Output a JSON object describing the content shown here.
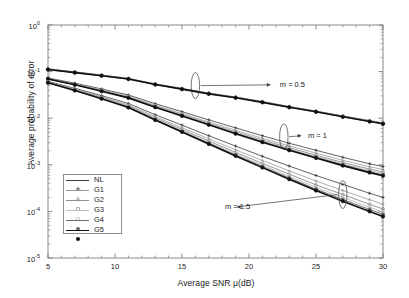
{
  "chart_data": {
    "type": "line",
    "title": "",
    "xlabel": "Average SNR μ(dB)",
    "ylabel": "Average probability of error",
    "xlim": [
      5,
      30
    ],
    "ylim": [
      1e-05,
      1
    ],
    "xscale": "linear",
    "yscale": "log",
    "xticks": [
      5,
      10,
      15,
      20,
      25,
      30
    ],
    "xticklabels": [
      "5",
      "10",
      "15",
      "20",
      "25",
      "30"
    ],
    "yticks": [
      1,
      0.1,
      0.01,
      0.001,
      0.0001,
      1e-05
    ],
    "yticklabels": [
      "10",
      "10",
      "10",
      "10",
      "10",
      "10"
    ],
    "yticklabel_exponents": [
      "0",
      "-1",
      "-2",
      "-3",
      "-4",
      "-5"
    ],
    "grid": false,
    "legend_position": "lower left",
    "x": [
      5,
      7,
      9,
      11,
      13,
      15,
      17,
      19,
      21,
      23,
      25,
      27,
      29,
      30
    ],
    "groups": [
      {
        "name": "m = 0.5",
        "series": [
          {
            "name": "NL",
            "values": [
              0.115,
              0.0985,
              0.0845,
              0.0715,
              0.0545,
              0.0435,
              0.0345,
              0.0285,
              0.0228,
              0.0178,
              0.0142,
              0.0112,
              0.0089,
              0.0079
            ]
          },
          {
            "name": "G1",
            "values": [
              0.113,
              0.097,
              0.0832,
              0.0705,
              0.0537,
              0.0428,
              0.034,
              0.028,
              0.0224,
              0.0175,
              0.014,
              0.011,
              0.0087,
              0.0078
            ]
          },
          {
            "name": "G2",
            "values": [
              0.112,
              0.0962,
              0.0825,
              0.07,
              0.0533,
              0.0425,
              0.0337,
              0.0278,
              0.0222,
              0.0174,
              0.0139,
              0.0109,
              0.0086,
              0.0077
            ]
          },
          {
            "name": "G3",
            "values": [
              0.112,
              0.0958,
              0.0821,
              0.0697,
              0.0531,
              0.0423,
              0.0336,
              0.0277,
              0.0221,
              0.0173,
              0.0138,
              0.0108,
              0.0086,
              0.0077
            ]
          },
          {
            "name": "G4",
            "values": [
              0.111,
              0.0955,
              0.0818,
              0.0694,
              0.0529,
              0.0421,
              0.0334,
              0.0276,
              0.022,
              0.0172,
              0.0137,
              0.0108,
              0.0085,
              0.0076
            ]
          },
          {
            "name": "G5",
            "values": [
              0.111,
              0.0952,
              0.0816,
              0.0692,
              0.0527,
              0.042,
              0.0333,
              0.0275,
              0.0219,
              0.0172,
              0.0137,
              0.0107,
              0.0085,
              0.0076
            ]
          }
        ]
      },
      {
        "name": "m = 1",
        "series": [
          {
            "name": "NL",
            "values": [
              0.073,
              0.0565,
              0.0425,
              0.0315,
              0.0205,
              0.0138,
              0.0092,
              0.0062,
              0.0042,
              0.0029,
              0.00205,
              0.00145,
              0.00105,
              0.00092
            ]
          },
          {
            "name": "G1",
            "values": [
              0.0715,
              0.0545,
              0.0405,
              0.0296,
              0.019,
              0.0126,
              0.0083,
              0.0055,
              0.0037,
              0.00255,
              0.00178,
              0.00125,
              0.00091,
              0.00079
            ]
          },
          {
            "name": "G2",
            "values": [
              0.0705,
              0.0535,
              0.0394,
              0.0286,
              0.0182,
              0.012,
              0.0078,
              0.0051,
              0.0034,
              0.00233,
              0.00161,
              0.00112,
              0.00081,
              0.0007
            ]
          },
          {
            "name": "G3",
            "values": [
              0.07,
              0.0528,
              0.0387,
              0.028,
              0.0177,
              0.0116,
              0.0075,
              0.0049,
              0.00325,
              0.0022,
              0.00152,
              0.00105,
              0.00075,
              0.00065
            ]
          },
          {
            "name": "G4",
            "values": [
              0.0696,
              0.0524,
              0.0383,
              0.0276,
              0.0174,
              0.0113,
              0.00732,
              0.00475,
              0.00313,
              0.00211,
              0.00145,
              0.001,
              0.00071,
              0.00061
            ]
          },
          {
            "name": "G5",
            "values": [
              0.0693,
              0.0521,
              0.038,
              0.0273,
              0.0172,
              0.0112,
              0.0072,
              0.00465,
              0.00305,
              0.00205,
              0.0014,
              0.00096,
              0.00068,
              0.00058
            ]
          }
        ]
      },
      {
        "name": "m = 1.5",
        "series": [
          {
            "name": "NL",
            "values": [
              0.0615,
              0.0438,
              0.0305,
              0.0207,
              0.0119,
              0.0071,
              0.0042,
              0.00252,
              0.00152,
              0.00094,
              0.00059,
              0.00038,
              0.000245,
              0.0002
            ]
          },
          {
            "name": "G1",
            "values": [
              0.06,
              0.042,
              0.0288,
              0.0192,
              0.0108,
              0.00625,
              0.0036,
              0.0021,
              0.00124,
              0.00074,
              0.00045,
              0.00028,
              0.000178,
              0.000143
            ]
          },
          {
            "name": "G2",
            "values": [
              0.059,
              0.0409,
              0.0277,
              0.0182,
              0.0101,
              0.00573,
              0.00324,
              0.00185,
              0.00107,
              0.00063,
              0.00037,
              0.00023,
              0.000142,
              0.000113
            ]
          },
          {
            "name": "G3",
            "values": [
              0.0584,
              0.0402,
              0.027,
              0.0176,
              0.00965,
              0.00542,
              0.00303,
              0.00171,
              0.00098,
              0.00056,
              0.00033,
              0.0002,
              0.000123,
              9.75e-05
            ]
          },
          {
            "name": "G4",
            "values": [
              0.058,
              0.0397,
              0.0265,
              0.0172,
              0.00935,
              0.0052,
              0.00289,
              0.00162,
              0.00092,
              0.00052,
              0.0003,
              0.00018,
              0.00011,
              8.65e-05
            ]
          },
          {
            "name": "G5",
            "values": [
              0.0577,
              0.0394,
              0.0262,
              0.0169,
              0.00915,
              0.00506,
              0.0028,
              0.00155,
              0.00087,
              0.00049,
              0.00028,
              0.000166,
              0.0001,
              7.8e-05
            ]
          }
        ]
      }
    ],
    "annotations": [
      {
        "text": "m = 0.5",
        "x": 22.3,
        "y": 0.052,
        "arrow": "right"
      },
      {
        "text": "m = 1",
        "x": 24.4,
        "y": 0.0042,
        "arrow": "right"
      },
      {
        "text": "m = 1.5",
        "x": 18.2,
        "y": 0.000125,
        "arrow": "left"
      }
    ]
  },
  "legend": {
    "items": [
      {
        "label": "NL",
        "marker": "plus",
        "color": "#3a3a3a",
        "width": 0.8
      },
      {
        "label": "G1",
        "marker": "plus",
        "color": "#9a9a9a",
        "width": 0.8
      },
      {
        "label": "G2",
        "marker": "circle",
        "color": "#8c8c8c",
        "width": 0.9
      },
      {
        "label": "G3",
        "marker": "circle",
        "color": "#bdbdbd",
        "width": 0.9
      },
      {
        "label": "G4",
        "marker": "dot",
        "color": "#6b6b6b",
        "width": 1.0
      },
      {
        "label": "G5",
        "marker": "dot",
        "color": "#111111",
        "width": 1.6
      }
    ]
  },
  "axes": {
    "xlabel": "Average SNR μ(dB)",
    "ylabel": "Average probability of error",
    "xticklabels": [
      "5",
      "10",
      "15",
      "20",
      "25",
      "30"
    ],
    "ytick_mantissa": "10",
    "ytick_exponents": [
      "0",
      "-1",
      "-2",
      "-3",
      "-4",
      "-5"
    ]
  },
  "colors": {
    "axis": "#7d7d7d",
    "text": "#1a1a1a",
    "background": "#ffffff"
  }
}
